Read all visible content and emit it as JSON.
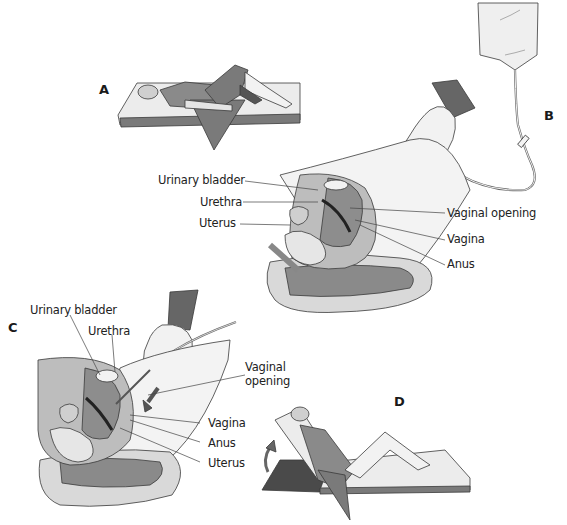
{
  "figure": {
    "panels": [
      {
        "id": "A",
        "letter": "A",
        "description": "Patient lying supine on a mattress with knees flexed, draped"
      },
      {
        "id": "B",
        "letter": "B",
        "description": "Sagittal view of female pelvis with gloved hand inserting irrigation nozzle connected to hanging fluid bag",
        "labels": {
          "urinary_bladder": "Urinary bladder",
          "urethra": "Urethra",
          "uterus": "Uterus",
          "vaginal_opening": "Vaginal opening",
          "vagina": "Vagina",
          "anus": "Anus"
        }
      },
      {
        "id": "C",
        "letter": "C",
        "description": "Sagittal view of pelvis with nozzle inserted into vagina, arrow indicating direction",
        "labels": {
          "urinary_bladder": "Urinary bladder",
          "urethra": "Urethra",
          "vaginal_opening_line1": "Vaginal",
          "vaginal_opening_line2": "opening",
          "vagina": "Vagina",
          "anus": "Anus",
          "uterus": "Uterus"
        }
      },
      {
        "id": "D",
        "letter": "D",
        "description": "Patient in semi-Fowler position with raised backrest, arrow indicating elevation"
      }
    ],
    "colors": {
      "outline": "#3a3a3a",
      "skin_light": "#e8e8e8",
      "tissue_mid": "#9a9a9a",
      "tissue_dark": "#6e6e6e",
      "gown": "#7a7a7a",
      "sleeve": "#555555",
      "mattress": "#ececec",
      "board": "#4a4a4a"
    }
  }
}
